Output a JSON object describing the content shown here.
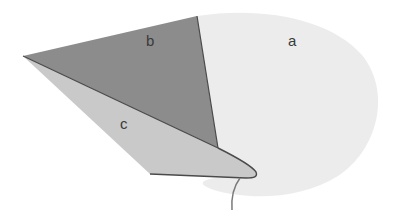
{
  "diagram": {
    "regions": [
      {
        "id": "a",
        "label": "a",
        "fill": "#ececec",
        "label_pos": [
          293,
          38
        ]
      },
      {
        "id": "b",
        "label": "b",
        "fill": "#8c8c8c",
        "label_pos": [
          150,
          39
        ]
      },
      {
        "id": "c",
        "label": "c",
        "fill": "#c9c9c9",
        "label_pos": [
          124,
          121
        ]
      }
    ],
    "colors": {
      "background": "#ffffff",
      "region_a": "#ececec",
      "region_b": "#8c8c8c",
      "region_c": "#c9c9c9",
      "outline": "#4a4a4a",
      "stem": "#7a7a7a",
      "label_text": "#3a3a3a"
    }
  }
}
